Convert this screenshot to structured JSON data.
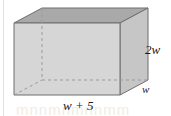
{
  "figure": {
    "name": "rectangular-prism-diagram",
    "shape": "rectangular prism",
    "colors": {
      "top_face": "#a9a9a9",
      "front_face": "#d6d6d6",
      "right_face": "#c6c6c6",
      "outline": "#6e6e6e",
      "hidden_edge": "#9a9a9a",
      "background": "#ffffff",
      "label_text": "#1a1a1a"
    },
    "labels": {
      "height": "2w",
      "depth": "w",
      "width": "w + 5"
    },
    "bleed_text": "mnnmnmnnmm"
  },
  "geometry": {
    "front_top_left": [
      14,
      23
    ],
    "front_top_right": [
      120,
      23
    ],
    "front_bottom_left": [
      14,
      95
    ],
    "front_bottom_right": [
      120,
      95
    ],
    "back_top_left": [
      42,
      8
    ],
    "back_top_right": [
      148,
      8
    ],
    "back_bottom_left": [
      42,
      80
    ],
    "back_bottom_right": [
      148,
      80
    ]
  }
}
